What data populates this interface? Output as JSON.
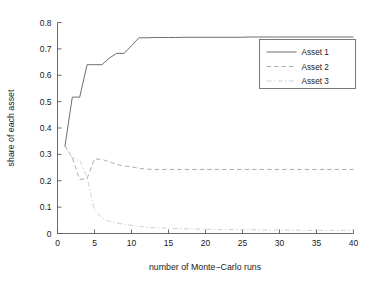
{
  "chart_data": {
    "type": "line",
    "title": "",
    "xlabel": "number of Monte−Carlo runs",
    "ylabel": "share of each asset",
    "xlim": [
      0,
      40
    ],
    "ylim": [
      0,
      0.8
    ],
    "xticks": [
      0,
      5,
      10,
      15,
      20,
      25,
      30,
      35,
      40
    ],
    "xtick_labels": [
      "0",
      "5",
      "10",
      "15",
      "20",
      "25",
      "30",
      "35",
      "40"
    ],
    "yticks": [
      0,
      0.1,
      0.2,
      0.3,
      0.4,
      0.5,
      0.6,
      0.7,
      0.8
    ],
    "ytick_labels": [
      "0",
      "0.1",
      "0.2",
      "0.3",
      "0.4",
      "0.5",
      "0.6",
      "0.7",
      "0.8"
    ],
    "grid": false,
    "legend_position": "upper right",
    "x": [
      1,
      2,
      3,
      4,
      5,
      6,
      7,
      8,
      9,
      10,
      11,
      12,
      13,
      14,
      15,
      16,
      17,
      18,
      19,
      20,
      21,
      22,
      23,
      24,
      25,
      26,
      27,
      28,
      29,
      30,
      31,
      32,
      33,
      34,
      35,
      36,
      37,
      38,
      39,
      40
    ],
    "series": [
      {
        "name": "Asset 1",
        "style": "solid",
        "color": "#6e6e6e",
        "values": [
          0.33,
          0.517,
          0.517,
          0.64,
          0.64,
          0.64,
          0.665,
          0.683,
          0.683,
          0.712,
          0.742,
          0.742,
          0.743,
          0.743,
          0.743,
          0.743,
          0.744,
          0.744,
          0.744,
          0.744,
          0.744,
          0.744,
          0.744,
          0.744,
          0.744,
          0.745,
          0.745,
          0.745,
          0.745,
          0.745,
          0.745,
          0.745,
          0.745,
          0.745,
          0.745,
          0.745,
          0.745,
          0.745,
          0.745,
          0.745
        ]
      },
      {
        "name": "Asset 2",
        "style": "dashed",
        "color": "#a8a8a8",
        "values": [
          0.335,
          0.286,
          0.205,
          0.208,
          0.283,
          0.281,
          0.272,
          0.262,
          0.256,
          0.253,
          0.247,
          0.244,
          0.243,
          0.243,
          0.243,
          0.243,
          0.243,
          0.243,
          0.243,
          0.243,
          0.243,
          0.243,
          0.243,
          0.243,
          0.243,
          0.243,
          0.243,
          0.243,
          0.243,
          0.243,
          0.243,
          0.243,
          0.243,
          0.243,
          0.243,
          0.243,
          0.243,
          0.243,
          0.243,
          0.243
        ]
      },
      {
        "name": "Asset 3",
        "style": "dashdot",
        "color": "#cccccc",
        "values": [
          0.33,
          0.287,
          0.28,
          0.212,
          0.088,
          0.06,
          0.046,
          0.04,
          0.035,
          0.031,
          0.027,
          0.024,
          0.022,
          0.021,
          0.02,
          0.019,
          0.018,
          0.017,
          0.017,
          0.016,
          0.016,
          0.015,
          0.015,
          0.015,
          0.014,
          0.014,
          0.014,
          0.013,
          0.013,
          0.013,
          0.013,
          0.013,
          0.012,
          0.012,
          0.012,
          0.012,
          0.012,
          0.012,
          0.012,
          0.012
        ]
      }
    ],
    "legend": [
      {
        "label": "Asset 1",
        "style": "solid",
        "color": "#6e6e6e"
      },
      {
        "label": "Asset 2",
        "style": "dashed",
        "color": "#a8a8a8"
      },
      {
        "label": "Asset 3",
        "style": "dashdot",
        "color": "#cccccc"
      }
    ]
  }
}
